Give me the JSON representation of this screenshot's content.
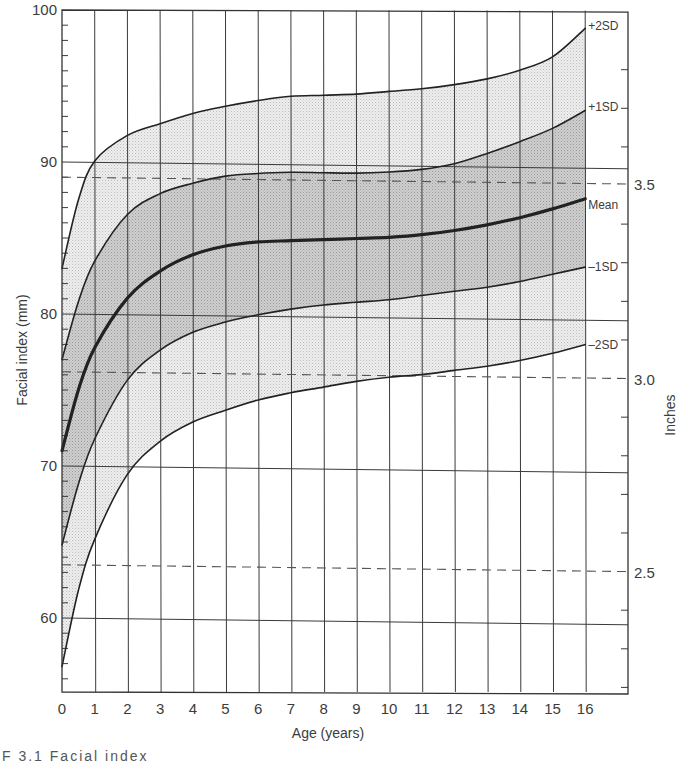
{
  "chart_data": {
    "type": "area",
    "title": "",
    "xlabel": "Age (years)",
    "ylabel": "Facial index (mm)",
    "secondary_ylabel": "Inches",
    "xlim": [
      0,
      17.3
    ],
    "ylim": [
      55,
      100
    ],
    "grid": true,
    "x": [
      0,
      0.5,
      1,
      2,
      3,
      4,
      5,
      6,
      7,
      8,
      9,
      10,
      11,
      12,
      13,
      14,
      15,
      16
    ],
    "series": [
      {
        "name": "+2SD",
        "label": "+2SD",
        "values": [
          83.0,
          87.5,
          90.1,
          91.8,
          92.6,
          93.3,
          93.8,
          94.2,
          94.5,
          94.6,
          94.7,
          94.9,
          95.1,
          95.4,
          95.8,
          96.4,
          97.3,
          99.2
        ]
      },
      {
        "name": "+1SD",
        "label": "+1SD",
        "values": [
          77.0,
          80.8,
          83.5,
          86.6,
          88.0,
          88.7,
          89.2,
          89.4,
          89.5,
          89.5,
          89.5,
          89.6,
          89.8,
          90.2,
          90.9,
          91.7,
          92.6,
          93.8
        ]
      },
      {
        "name": "Mean",
        "label": "Mean",
        "values": [
          71.0,
          75.0,
          77.8,
          81.1,
          82.9,
          84.0,
          84.6,
          84.9,
          85.0,
          85.1,
          85.2,
          85.3,
          85.5,
          85.8,
          86.2,
          86.7,
          87.3,
          88.0
        ]
      },
      {
        "name": "-1SD",
        "label": "-1SD",
        "values": [
          64.8,
          68.8,
          71.8,
          75.7,
          77.7,
          78.9,
          79.6,
          80.1,
          80.5,
          80.8,
          81.0,
          81.2,
          81.5,
          81.8,
          82.1,
          82.5,
          83.0,
          83.5
        ]
      },
      {
        "name": "-2SD",
        "label": "-2SD",
        "values": [
          56.8,
          61.8,
          65.2,
          69.5,
          71.7,
          73.0,
          73.8,
          74.5,
          75.0,
          75.4,
          75.8,
          76.1,
          76.3,
          76.6,
          76.9,
          77.3,
          77.8,
          78.4
        ]
      }
    ],
    "bands": [
      {
        "from": "+1SD",
        "to": "-1SD",
        "shade": "dark"
      },
      {
        "from": "+2SD",
        "to": "+1SD",
        "shade": "light"
      },
      {
        "from": "-1SD",
        "to": "-2SD",
        "shade": "light"
      }
    ],
    "x_ticks": [
      "0",
      "1",
      "2",
      "3",
      "4",
      "5",
      "6",
      "7",
      "8",
      "9",
      "10",
      "11",
      "12",
      "13",
      "14",
      "15",
      "16"
    ],
    "y_ticks": [
      {
        "value": 100,
        "label": "100"
      },
      {
        "value": 90,
        "label": "90"
      },
      {
        "value": 80,
        "label": "80"
      },
      {
        "value": 70,
        "label": "70"
      },
      {
        "value": 60,
        "label": "60"
      }
    ],
    "secondary_y_ticks": [
      {
        "mm": 89.0,
        "label": "3.5"
      },
      {
        "mm": 76.2,
        "label": "3.0"
      },
      {
        "mm": 63.5,
        "label": "2.5"
      }
    ],
    "colors": {
      "line": "#222222",
      "grid": "#3a3a3a",
      "band_dark": "#c9c9c9",
      "band_light": "#e6e6e6",
      "dashed": "#555555"
    }
  },
  "caption": "F  3.1  Facial index"
}
